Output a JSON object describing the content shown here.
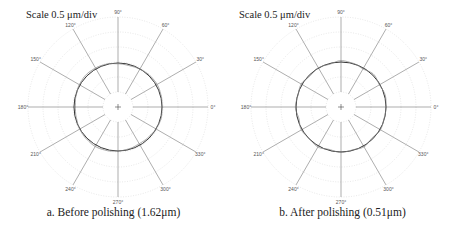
{
  "chart_data": [
    {
      "type": "polar-roundness",
      "scale_label": "Scale 0.5 μm/div",
      "caption": "a. Before polishing (1.62μm)",
      "angle_labels": [
        "0°",
        "30°",
        "60°",
        "90°",
        "120°",
        "150°",
        "180°",
        "210°",
        "240°",
        "300°",
        "270°",
        "330°"
      ],
      "angles": [
        0,
        30,
        60,
        90,
        120,
        150,
        180,
        210,
        240,
        300,
        270,
        330
      ],
      "grid_rings": 6,
      "scale_um_per_div": 0.5,
      "roundness_error_um": 1.62,
      "center": [
        118,
        107
      ],
      "reference_radius": 44,
      "profile_deviation": [
        0.0,
        0.6,
        1.2,
        0.8,
        -0.4,
        -1.2,
        -0.8,
        0.4,
        1.0,
        1.4,
        0.6,
        -0.6,
        -1.4,
        -1.0,
        0.2,
        0.9,
        1.6,
        1.0,
        0.0,
        -0.8,
        -1.6,
        -1.2,
        -0.4,
        0.6
      ]
    },
    {
      "type": "polar-roundness",
      "scale_label": "Scale 0.5 μm/div",
      "caption": "b. After polishing (0.51μm)",
      "angle_labels": [
        "0°",
        "30°",
        "60°",
        "90°",
        "120°",
        "150°",
        "180°",
        "210°",
        "240°",
        "300°",
        "270°",
        "330°"
      ],
      "angles": [
        0,
        30,
        60,
        90,
        120,
        150,
        180,
        210,
        240,
        300,
        270,
        330
      ],
      "grid_rings": 6,
      "scale_um_per_div": 0.5,
      "roundness_error_um": 0.51,
      "center": [
        116,
        107
      ],
      "reference_radius": 45,
      "profile_deviation": [
        0.0,
        0.8,
        -0.6,
        1.2,
        -1.0,
        0.4,
        1.4,
        -0.8,
        0.2,
        -1.2,
        1.0,
        -0.4,
        0.6,
        -1.4,
        0.8,
        -0.2,
        1.2,
        -1.0,
        0.4,
        -0.6,
        1.0,
        -1.2,
        0.6,
        -0.4
      ]
    }
  ]
}
